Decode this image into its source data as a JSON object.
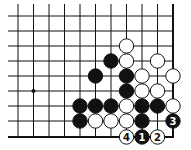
{
  "diagram": {
    "type": "go-problem",
    "grid": {
      "columns_x": [
        18,
        33.5,
        49,
        64.5,
        80,
        95.5,
        111,
        126.5,
        142,
        157.5,
        173
      ],
      "rows_y": [
        16,
        31,
        46,
        61,
        76,
        91,
        106,
        121,
        137
      ],
      "right_edge": true,
      "bottom_edge": true,
      "line_left_start": 8,
      "line_top_start": 4,
      "line_color": "#111111",
      "edge_width": 2
    },
    "star_points": [
      [
        1,
        5
      ]
    ],
    "stones": [
      {
        "color": "white",
        "col": 7,
        "row": 2
      },
      {
        "color": "black",
        "col": 6,
        "row": 3
      },
      {
        "color": "white",
        "col": 7,
        "row": 3
      },
      {
        "color": "white",
        "col": 9,
        "row": 3
      },
      {
        "color": "black",
        "col": 5,
        "row": 4
      },
      {
        "color": "black",
        "col": 7,
        "row": 4
      },
      {
        "color": "white",
        "col": 8,
        "row": 4
      },
      {
        "color": "white",
        "col": 10,
        "row": 4
      },
      {
        "color": "black",
        "col": 7,
        "row": 5
      },
      {
        "color": "white",
        "col": 8,
        "row": 5
      },
      {
        "color": "white",
        "col": 9,
        "row": 5
      },
      {
        "color": "black",
        "col": 4,
        "row": 6
      },
      {
        "color": "black",
        "col": 5,
        "row": 6
      },
      {
        "color": "black",
        "col": 6,
        "row": 6
      },
      {
        "color": "white",
        "col": 7,
        "row": 6
      },
      {
        "color": "black",
        "col": 8,
        "row": 6
      },
      {
        "color": "black",
        "col": 9,
        "row": 6
      },
      {
        "color": "white",
        "col": 10,
        "row": 6
      },
      {
        "color": "black",
        "col": 4,
        "row": 7
      },
      {
        "color": "white",
        "col": 5,
        "row": 7
      },
      {
        "color": "white",
        "col": 6,
        "row": 7
      },
      {
        "color": "white",
        "col": 7,
        "row": 7
      },
      {
        "color": "black",
        "col": 8,
        "row": 7
      },
      {
        "color": "black",
        "col": 10,
        "row": 7,
        "label": "3"
      },
      {
        "color": "white",
        "col": 7,
        "row": 8,
        "label": "4"
      },
      {
        "color": "black",
        "col": 8,
        "row": 8,
        "label": "1"
      },
      {
        "color": "white",
        "col": 9,
        "row": 8,
        "label": "2"
      }
    ],
    "colors": {
      "black_stone": "#111111",
      "white_stone": "#ffffff",
      "stone_outline": "#111111",
      "background": "#ffffff"
    }
  }
}
